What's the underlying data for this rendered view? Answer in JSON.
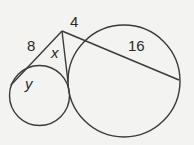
{
  "diagram": {
    "type": "geometry-circles-secants-tangents",
    "labels": {
      "segment_8": "8",
      "segment_4": "4",
      "segment_16": "16",
      "variable_x": "x",
      "variable_y": "y"
    },
    "stroke_color": "#3a3a3a",
    "background": "#f3f3f1",
    "shapes": {
      "small_circle": {
        "cx": 39.5,
        "cy": 95.5,
        "r": 30
      },
      "big_circle": {
        "cx": 124,
        "cy": 81,
        "r": 56
      },
      "apex": {
        "x": 62,
        "y": 31
      },
      "secant_small_end": {
        "x": 11,
        "y": 85
      },
      "tangent_point": {
        "x": 68,
        "y": 82
      },
      "secant_big_end": {
        "x": 179,
        "y": 80
      }
    }
  }
}
